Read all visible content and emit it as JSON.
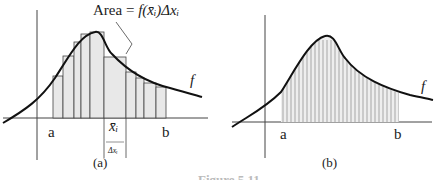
{
  "panel_a": {
    "annotation_prefix": "Area",
    "annotation_eq": "=",
    "annotation_formula": "f(x̄ᵢ)Δxᵢ",
    "label_a": "a",
    "label_b": "b",
    "label_xi": "x̄ᵢ",
    "label_dx": "Δxᵢ",
    "label_f": "f",
    "caption": "(a)"
  },
  "panel_b": {
    "label_a": "a",
    "label_b": "b",
    "label_f": "f",
    "caption": "(b)"
  },
  "figure_caption": "Figure 5.11",
  "colors": {
    "fill": "#e8e8e8",
    "stroke": "#111111"
  }
}
